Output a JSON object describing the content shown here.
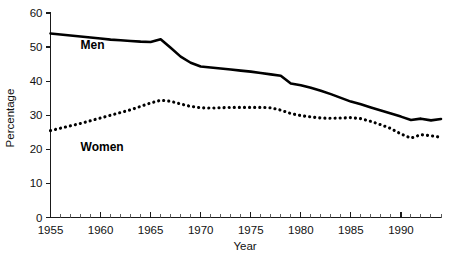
{
  "chart_data": {
    "type": "line",
    "title": "",
    "xlabel": "Year",
    "ylabel": "Percentage",
    "xlim": [
      1955,
      1994
    ],
    "ylim": [
      0,
      60
    ],
    "xticks": [
      1955,
      1960,
      1965,
      1970,
      1975,
      1980,
      1985,
      1990
    ],
    "yticks": [
      0,
      10,
      20,
      30,
      40,
      50,
      60
    ],
    "xticklabels": [
      "1955",
      "1960",
      "1965",
      "1970",
      "1975",
      "1980",
      "1985",
      "1990"
    ],
    "yticklabels": [
      "0",
      "10",
      "20",
      "30",
      "40",
      "50",
      "60"
    ],
    "grid": false,
    "legend_position": "inline-annotation",
    "minor_tick_interval": 1,
    "x": [
      1955,
      1956,
      1957,
      1958,
      1959,
      1960,
      1961,
      1962,
      1963,
      1964,
      1965,
      1966,
      1967,
      1968,
      1969,
      1970,
      1971,
      1972,
      1973,
      1974,
      1975,
      1976,
      1977,
      1978,
      1979,
      1980,
      1981,
      1982,
      1983,
      1984,
      1985,
      1986,
      1987,
      1988,
      1989,
      1990,
      1991,
      1992,
      1993,
      1994
    ],
    "series": [
      {
        "name": "Men",
        "style": "solid",
        "color": "#000000",
        "values": [
          54.0,
          53.7,
          53.4,
          53.1,
          52.8,
          52.5,
          52.2,
          52.0,
          51.8,
          51.6,
          51.5,
          52.3,
          49.8,
          47.2,
          45.4,
          44.3,
          44.0,
          43.7,
          43.4,
          43.1,
          42.8,
          42.4,
          42.0,
          41.6,
          39.3,
          38.8,
          38.1,
          37.2,
          36.2,
          35.1,
          34.0,
          33.2,
          32.3,
          31.4,
          30.5,
          29.6,
          28.6,
          29.0,
          28.5,
          28.9
        ]
      },
      {
        "name": "Women",
        "style": "dotted",
        "color": "#000000",
        "values": [
          25.5,
          26.2,
          26.9,
          27.6,
          28.4,
          29.2,
          30.0,
          30.8,
          31.6,
          32.6,
          33.6,
          34.4,
          34.1,
          33.3,
          32.6,
          32.2,
          32.1,
          32.2,
          32.3,
          32.3,
          32.3,
          32.3,
          32.2,
          31.5,
          30.5,
          29.9,
          29.5,
          29.2,
          29.1,
          29.2,
          29.3,
          29.0,
          28.2,
          27.2,
          26.1,
          24.5,
          23.3,
          24.3,
          24.0,
          23.5
        ]
      }
    ],
    "annotations": [
      {
        "text": "Men",
        "x": 1958.0,
        "y": 49.5
      },
      {
        "text": "Women",
        "x": 1958.0,
        "y": 19.5
      }
    ]
  }
}
